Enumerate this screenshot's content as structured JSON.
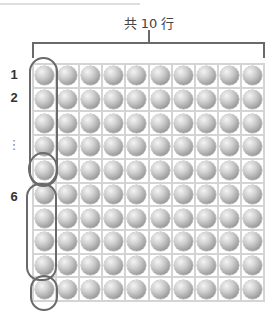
{
  "diagram": {
    "bracket_label": "共 10 行",
    "grid": {
      "rows": 10,
      "cols": 10,
      "item": "ball"
    },
    "row_labels": [
      {
        "text": "1",
        "row": 1
      },
      {
        "text": "2",
        "row": 2
      },
      {
        "text": "⋮",
        "row": 4
      },
      {
        "text": "6",
        "row": 6
      }
    ],
    "groupings": [
      {
        "name": "group-rows-1-5",
        "from_row": 1,
        "to_row": 5,
        "shape": "oval"
      },
      {
        "name": "group-row-5",
        "from_row": 5,
        "to_row": 5,
        "shape": "circle"
      },
      {
        "name": "group-rows-6-9",
        "from_row": 6,
        "to_row": 9,
        "shape": "oval"
      },
      {
        "name": "group-row-10",
        "from_row": 10,
        "to_row": 10,
        "shape": "circle"
      }
    ],
    "colors": {
      "outline": "#6a6a6a",
      "grid_line": "#d4d4d4",
      "ball_light": "#f4f4f4",
      "ball_dark": "#7a7a7a"
    }
  }
}
